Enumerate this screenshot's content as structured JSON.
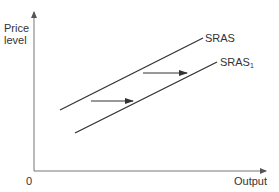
{
  "diagram": {
    "y_axis_label_line1": "Price",
    "y_axis_label_line2": "level",
    "x_axis_label": "Output",
    "origin_label": "0",
    "curves": [
      {
        "name": "SRAS",
        "label": "SRAS",
        "subscript": ""
      },
      {
        "name": "SRAS1",
        "label": "SRAS",
        "subscript": "1"
      }
    ],
    "shift_direction": "right",
    "colors": {
      "line": "#333333",
      "axis": "#666666",
      "background": "#ffffff"
    }
  }
}
